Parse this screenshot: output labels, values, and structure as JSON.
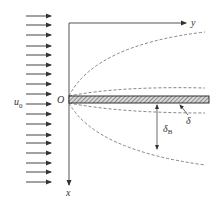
{
  "diagram": {
    "labels": {
      "freestream_velocity": "u",
      "freestream_velocity_sub": "0",
      "origin": "O",
      "x_axis": "x",
      "y_axis": "y",
      "delta": "δ",
      "delta_B": "δ",
      "delta_B_sub": "B"
    },
    "colors": {
      "line": "#333333",
      "axis": "#555555",
      "dashed": "#666666",
      "plate_fill": "#9a9a9a"
    },
    "arrows_y": [
      16,
      25,
      35,
      46,
      55,
      65,
      74,
      84,
      94,
      104,
      114,
      124,
      135,
      143,
      153,
      163,
      172,
      182
    ]
  }
}
